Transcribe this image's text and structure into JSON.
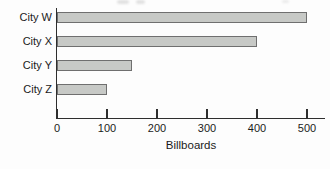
{
  "chart_data": {
    "type": "bar",
    "orientation": "horizontal",
    "title": "",
    "categories": [
      "City W",
      "City X",
      "City Y",
      "City Z"
    ],
    "values": [
      500,
      400,
      150,
      100
    ],
    "xlabel": "Billboards",
    "ylabel": "",
    "x_ticks": [
      0,
      100,
      200,
      300,
      400,
      500
    ],
    "xlim": [
      0,
      535
    ],
    "grid": false,
    "legend": false,
    "colors": {
      "bar_fill": "#c7c9c6",
      "bar_border": "#6f6f6f",
      "axis": "#2e2e2e",
      "text": "#1b1b1b",
      "background": "#fdfdfd"
    }
  }
}
